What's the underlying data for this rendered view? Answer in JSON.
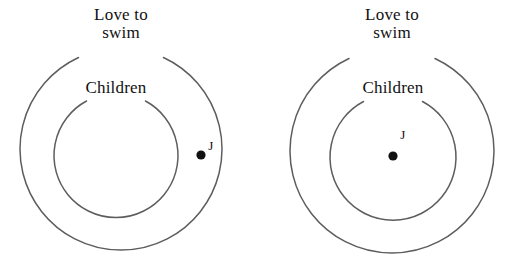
{
  "figure": {
    "type": "euler-diagram-pair",
    "background_color": "#ffffff",
    "stroke_color": "#5d5d5d",
    "text_color": "#111111"
  },
  "diagrams": [
    {
      "id": "left",
      "outer_set_label_line1": "Love to",
      "outer_set_label_line2": "swim",
      "inner_set_label": "Children",
      "point_label": "J",
      "point_location": "inside outer set, outside inner set"
    },
    {
      "id": "right",
      "outer_set_label_line1": "Love to",
      "outer_set_label_line2": "swim",
      "inner_set_label": "Children",
      "point_label": "J",
      "point_location": "inside inner set"
    }
  ]
}
